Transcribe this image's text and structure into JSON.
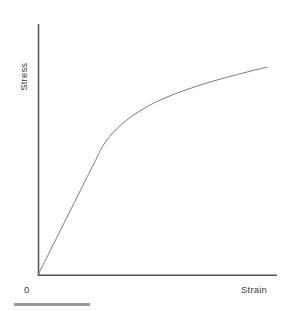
{
  "figure": {
    "width": 291,
    "height": 311,
    "background_color": "#ffffff"
  },
  "labels": {
    "ylabel": "Stress",
    "xlabel": "Strain",
    "origin": "0"
  },
  "colors": {
    "axis": "#555555",
    "curve": "#7a7a7a",
    "text": "#3a3a3a",
    "scale_bar": "#9a9a9a"
  },
  "scale_bar": {
    "name": "scale-bar",
    "x": 14,
    "y": 303,
    "width": 76,
    "height": 3
  },
  "chart_data": {
    "type": "line",
    "title": "",
    "subtitle": "",
    "xlabel": "Strain",
    "ylabel": "Stress",
    "xlim": [
      0,
      1
    ],
    "ylim": [
      0,
      1
    ],
    "grid": false,
    "legend": "none",
    "axis_ticks": {
      "x": [],
      "y": []
    },
    "annotations": [
      {
        "text": "0",
        "x": 0,
        "y": 0,
        "position": "below-left-of-origin"
      }
    ],
    "series": [
      {
        "name": "stress-strain-curve",
        "color": "#7a7a7a",
        "linewidth": 1,
        "description": "Elastic linear region followed by yielding and strain hardening (plastic plateau with decreasing slope)",
        "x": [
          0.0,
          0.05,
          0.1,
          0.15,
          0.2,
          0.25,
          0.26,
          0.28,
          0.3,
          0.33,
          0.37,
          0.42,
          0.48,
          0.54,
          0.6,
          0.66,
          0.72,
          0.78,
          0.84,
          0.9,
          0.96
        ],
        "y": [
          0.0,
          0.095,
          0.19,
          0.285,
          0.38,
          0.474,
          0.495,
          0.527,
          0.552,
          0.583,
          0.616,
          0.65,
          0.683,
          0.709,
          0.731,
          0.751,
          0.769,
          0.785,
          0.8,
          0.815,
          0.828
        ]
      }
    ],
    "key_points": {
      "origin": {
        "x": 0.0,
        "y": 0.0
      },
      "yield_point": {
        "x": 0.26,
        "y": 0.495
      },
      "end_point": {
        "x": 0.96,
        "y": 0.828
      }
    },
    "plot_box_px": {
      "x_axis_y": 275,
      "y_axis_x": 38,
      "x_axis_start": 38,
      "x_axis_end": 277,
      "y_axis_top": 24,
      "y_axis_bottom": 275
    }
  }
}
